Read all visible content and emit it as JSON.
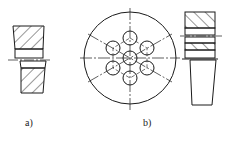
{
  "figure": {
    "panels": [
      {
        "id": "a",
        "label": "a)"
      },
      {
        "id": "b",
        "label": "b)"
      },
      {
        "id": "c",
        "label": ""
      }
    ]
  },
  "colors": {
    "line": "#1a1a1a",
    "background": "#ffffff"
  }
}
